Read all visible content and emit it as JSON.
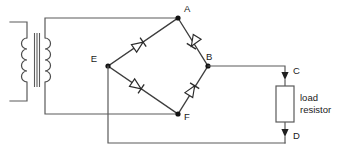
{
  "diagram": {
    "background_color": "#ffffff",
    "wire_color": "#5a5a5a",
    "label_color": "#1a1a1a"
  },
  "nodes": {
    "a": "A",
    "b": "B",
    "c": "C",
    "d": "D",
    "e": "E",
    "f": "F"
  },
  "components": {
    "transformer": {
      "name": "transformer",
      "primary_turns": 4,
      "secondary_turns": 4
    },
    "bridge": {
      "name": "bridge-rectifier",
      "diodes": [
        {
          "id": "diode-top-left",
          "from": "E",
          "to": "A",
          "direction": "up-right"
        },
        {
          "id": "diode-top-right",
          "from": "B",
          "to": "A",
          "direction": "up-left"
        },
        {
          "id": "diode-bottom-left",
          "from": "E",
          "to": "F",
          "direction": "down-right"
        },
        {
          "id": "diode-bottom-right",
          "from": "F",
          "to": "B",
          "direction": "up-right"
        }
      ]
    },
    "load_resistor": {
      "label_line1": "load",
      "label_line2": "resistor",
      "top_terminal": "C",
      "bottom_terminal": "D"
    }
  }
}
